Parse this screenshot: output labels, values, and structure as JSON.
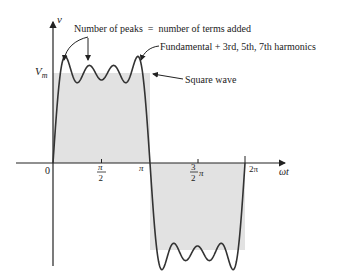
{
  "figure": {
    "type": "Fourier synthesis of square wave",
    "axes": {
      "y_label": "v",
      "x_label": "ωt",
      "origin_label": "0",
      "amplitude_label_main": "V",
      "amplitude_label_sub": "m",
      "x_ticks": [
        {
          "label_num": "π",
          "label_den": "2",
          "kind": "fraction"
        },
        {
          "label": "π",
          "kind": "plain"
        },
        {
          "label_num": "3",
          "label_den": "2",
          "suffix": "π",
          "kind": "fraction-suffix"
        },
        {
          "label": "2π",
          "kind": "plain"
        }
      ]
    },
    "annotations": {
      "peaks": "Number of peaks  =  number of terms added",
      "harmonics": "Fundamental + 3rd, 5th, 7th harmonics",
      "square": "Square wave"
    },
    "colors": {
      "fill": "#e2e2e2",
      "line": "#333333",
      "axis": "#222222"
    },
    "harmonics_used": [
      1,
      3,
      5,
      7
    ]
  }
}
